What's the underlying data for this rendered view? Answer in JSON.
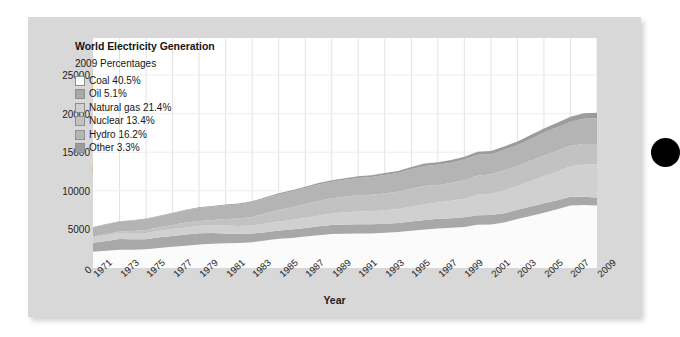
{
  "legend": {
    "title": "World Electricity Generation",
    "subtitle": "2009 Percentages",
    "entries": [
      {
        "label": "Coal 40.5%",
        "color": "#fbfbfb"
      },
      {
        "label": "Oil 5.1%",
        "color": "#a8a8a8"
      },
      {
        "label": "Natural gas 21.4%",
        "color": "#d0d0d0"
      },
      {
        "label": "Nuclear 13.4%",
        "color": "#c2c2c2"
      },
      {
        "label": "Hydro 16.2%",
        "color": "#b4b4b4"
      },
      {
        "label": "Other 3.3%",
        "color": "#9c9c9c"
      }
    ]
  },
  "axes": {
    "ylabel": "Terawatt-hours (TWh)",
    "xlabel": "Year",
    "yticks": [
      "0",
      "5000",
      "10000",
      "15000",
      "20000",
      "25000"
    ],
    "xticks": [
      "1971",
      "1973",
      "1975",
      "1977",
      "1979",
      "1981",
      "1983",
      "1985",
      "1987",
      "1989",
      "1991",
      "1993",
      "1995",
      "1997",
      "1999",
      "2001",
      "2003",
      "2005",
      "2007",
      "2009"
    ]
  },
  "decor": {
    "circle_color": "#000000"
  },
  "chart_data": {
    "type": "area",
    "title": "World Electricity Generation",
    "subtitle": "2009 Percentages",
    "xlabel": "Year",
    "ylabel": "Terawatt-hours (TWh)",
    "xlim": [
      1971,
      2009
    ],
    "ylim": [
      0,
      29800
    ],
    "yticks": [
      0,
      5000,
      10000,
      15000,
      20000,
      25000
    ],
    "grid": "vertical",
    "legend_position": "inside-top-left",
    "stacked": true,
    "stack_order_bottom_to_top": [
      "Coal",
      "Oil",
      "Natural gas",
      "Nuclear",
      "Hydro",
      "Other"
    ],
    "x": [
      1971,
      1972,
      1973,
      1974,
      1975,
      1976,
      1977,
      1978,
      1979,
      1980,
      1981,
      1982,
      1983,
      1984,
      1985,
      1986,
      1987,
      1988,
      1989,
      1990,
      1991,
      1992,
      1993,
      1994,
      1995,
      1996,
      1997,
      1998,
      1999,
      2000,
      2001,
      2002,
      2003,
      2004,
      2005,
      2006,
      2007,
      2008,
      2009
    ],
    "series": [
      {
        "name": "Coal",
        "color": "#fbfbfb",
        "percent_2009": 40.5,
        "values": [
          2100,
          2230,
          2360,
          2380,
          2430,
          2600,
          2740,
          2880,
          3040,
          3150,
          3210,
          3230,
          3350,
          3550,
          3790,
          3900,
          4080,
          4250,
          4400,
          4450,
          4470,
          4480,
          4560,
          4650,
          4820,
          5000,
          5130,
          5200,
          5300,
          5600,
          5650,
          5900,
          6350,
          6750,
          7150,
          7600,
          8100,
          8150,
          8100
        ]
      },
      {
        "name": "Oil",
        "color": "#a8a8a8",
        "percent_2009": 5.1,
        "values": [
          1180,
          1280,
          1390,
          1340,
          1300,
          1380,
          1410,
          1450,
          1450,
          1370,
          1270,
          1180,
          1120,
          1080,
          1060,
          1100,
          1110,
          1150,
          1180,
          1200,
          1200,
          1190,
          1180,
          1190,
          1210,
          1230,
          1250,
          1260,
          1260,
          1250,
          1220,
          1200,
          1210,
          1220,
          1230,
          1180,
          1140,
          1080,
          1020
        ]
      },
      {
        "name": "Natural gas",
        "color": "#d0d0d0",
        "percent_2009": 21.4,
        "values": [
          690,
          740,
          790,
          800,
          810,
          860,
          900,
          930,
          980,
          1020,
          1040,
          1040,
          1050,
          1120,
          1180,
          1220,
          1290,
          1370,
          1470,
          1570,
          1640,
          1680,
          1740,
          1810,
          1910,
          2010,
          2120,
          2250,
          2420,
          2660,
          2760,
          2940,
          3100,
          3280,
          3500,
          3700,
          3950,
          4150,
          4280
        ]
      },
      {
        "name": "Nuclear",
        "color": "#c2c2c2",
        "percent_2009": 13.4,
        "values": [
          110,
          150,
          200,
          260,
          370,
          430,
          530,
          620,
          630,
          680,
          830,
          950,
          1080,
          1320,
          1500,
          1630,
          1800,
          1900,
          1980,
          2010,
          2100,
          2130,
          2180,
          2230,
          2330,
          2400,
          2250,
          2300,
          2400,
          2450,
          2520,
          2600,
          2590,
          2660,
          2700,
          2700,
          2650,
          2680,
          2680
        ]
      },
      {
        "name": "Hydro",
        "color": "#b4b4b4",
        "percent_2009": 16.2,
        "values": [
          1190,
          1240,
          1280,
          1350,
          1430,
          1440,
          1510,
          1600,
          1670,
          1720,
          1790,
          1840,
          1930,
          1970,
          2000,
          2060,
          2090,
          2160,
          2160,
          2190,
          2260,
          2310,
          2400,
          2430,
          2540,
          2580,
          2620,
          2640,
          2670,
          2700,
          2600,
          2660,
          2660,
          2800,
          2960,
          3050,
          3120,
          3290,
          3330
        ]
      },
      {
        "name": "Other",
        "color": "#9c9c9c",
        "percent_2009": 3.3,
        "values": [
          40,
          45,
          50,
          55,
          60,
          65,
          70,
          80,
          85,
          90,
          100,
          110,
          120,
          130,
          140,
          150,
          165,
          180,
          195,
          210,
          225,
          240,
          255,
          270,
          290,
          310,
          330,
          350,
          370,
          400,
          420,
          445,
          470,
          510,
          545,
          590,
          640,
          690,
          720
        ]
      }
    ]
  }
}
